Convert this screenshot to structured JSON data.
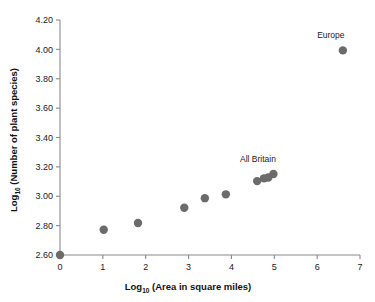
{
  "chart_data": {
    "type": "scatter",
    "title": "",
    "xlabel": "Log10 (Area in square miles)",
    "ylabel": "Log10 (Number of plant species)",
    "xlabel_base": "Log",
    "xlabel_sub": "10",
    "xlabel_rest": " (Area in square miles)",
    "ylabel_base": "Log",
    "ylabel_sub": "10",
    "ylabel_rest": " (Number of plant species)",
    "xlim": [
      0,
      7
    ],
    "ylim": [
      2.6,
      4.2
    ],
    "grid": false,
    "legend": "none",
    "xticks": [
      0,
      1,
      2,
      3,
      4,
      5,
      6,
      7
    ],
    "xtick_labels": [
      "0",
      "1",
      "2",
      "3",
      "4",
      "5",
      "6",
      "7"
    ],
    "yticks": [
      2.6,
      2.8,
      3.0,
      3.2,
      3.4,
      3.6,
      3.8,
      4.0,
      4.2
    ],
    "ytick_labels": [
      "2.60",
      "2.80",
      "3.00",
      "3.20",
      "3.40",
      "3.60",
      "3.80",
      "4.00",
      "4.20"
    ],
    "marker_color": "#6b6b6b",
    "axis_color": "#8a8a8a",
    "points": [
      {
        "x": 0.0,
        "y": 2.6,
        "label": ""
      },
      {
        "x": 1.02,
        "y": 2.772,
        "label": ""
      },
      {
        "x": 1.82,
        "y": 2.818,
        "label": ""
      },
      {
        "x": 2.9,
        "y": 2.922,
        "label": ""
      },
      {
        "x": 3.38,
        "y": 2.987,
        "label": ""
      },
      {
        "x": 3.87,
        "y": 3.013,
        "label": ""
      },
      {
        "x": 4.6,
        "y": 3.103,
        "label": ""
      },
      {
        "x": 4.76,
        "y": 3.122,
        "label": ""
      },
      {
        "x": 4.86,
        "y": 3.128,
        "label": ""
      },
      {
        "x": 4.98,
        "y": 3.152,
        "label": ""
      },
      {
        "x": 6.6,
        "y": 3.993,
        "label": "Europe"
      }
    ],
    "annotations": [
      {
        "text": "Europe",
        "x": 6.32,
        "y": 4.075
      },
      {
        "text": "All Britain",
        "x": 4.62,
        "y": 3.232
      }
    ]
  }
}
